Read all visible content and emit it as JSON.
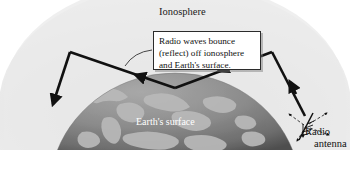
{
  "figure": {
    "title_labels": {
      "ionosphere": "Ionosphere",
      "earth_surface": "Earth's surface",
      "radio_antenna_line1": "Radio",
      "radio_antenna_line2": "antenna"
    },
    "callout": {
      "line1": "Radio waves bounce",
      "line2": "(reflect) off ionosphere",
      "line3": "and Earth's surface."
    },
    "colors": {
      "background": "#ffffff",
      "ionosphere_fill": "#ebebeb",
      "ionosphere_inner": "#e2e2e2",
      "earth_ocean": "#8e8e8e",
      "earth_land": "#b9b9b9",
      "earth_shadow": "#5a5a5a",
      "ray_stroke": "#111111",
      "callout_border": "#2b2b2b",
      "callout_fill": "#ffffff",
      "label_dark": "#1a1a1a",
      "label_light": "#ffffff"
    }
  }
}
